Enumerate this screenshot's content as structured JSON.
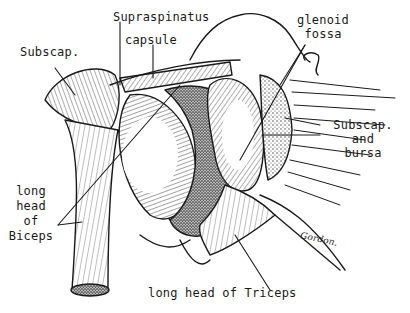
{
  "figure": {
    "labels": {
      "supraspinatus": "Supraspinatus",
      "capsule": "capsule",
      "subscap": "Subscap.",
      "glenoid_line1": "glenoid",
      "glenoid_line2": "fossa",
      "subscap_bursa_line1": "Subscap.",
      "subscap_bursa_line2": "and",
      "subscap_bursa_line3": "bursa",
      "biceps_line1": "long",
      "biceps_line2": "head",
      "biceps_line3": "of",
      "biceps_line4": "Biceps",
      "triceps": "long head of Triceps",
      "signature": "Gordon."
    },
    "colors": {
      "ink": "#1a1a1a",
      "paper": "#ffffff",
      "stipple": "#555555"
    }
  }
}
